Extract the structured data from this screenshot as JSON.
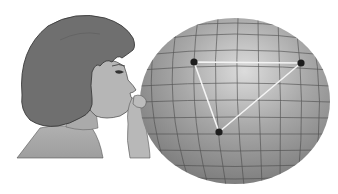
{
  "illustration": {
    "subject": "girl-blowing-balloon",
    "description": "A girl in profile blowing up a spherical balloon with a latitude/longitude grid and a triangle drawn on its surface",
    "colors": {
      "background": "#ffffff",
      "hair": "#6f6f6f",
      "hair_outline": "#3a3a3a",
      "skin": "#b4b4b4",
      "skin_shadow": "#a2a2a2",
      "shirt": "#a8a8a8",
      "balloon_light": "#d2d2d2",
      "balloon_mid": "#9c9c9c",
      "balloon_dark": "#7a7a7a",
      "grid": "#4a4a4a",
      "triangle": "#f4f4f4",
      "vertex": "#1e1e1e"
    },
    "balloon": {
      "cx": 235,
      "cy": 101,
      "rx": 95,
      "ry": 83
    },
    "triangle": {
      "vertices": [
        {
          "name": "A",
          "x": 194,
          "y": 62
        },
        {
          "name": "B",
          "x": 301,
          "y": 63
        },
        {
          "name": "C",
          "x": 219,
          "y": 132
        }
      ]
    }
  }
}
